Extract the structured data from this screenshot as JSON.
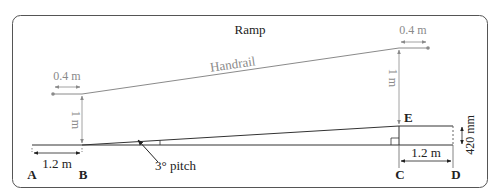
{
  "title": "Ramp",
  "labels": {
    "handrail": "Handrail",
    "left_overhang": "0.4 m",
    "right_overhang": "0.4 m",
    "left_height": "1 m",
    "right_height": "1 m",
    "left_landing": "1.2 m",
    "right_landing": "1.2 m",
    "rise": "420 mm",
    "pitch": "3° pitch"
  },
  "points": {
    "A": "A",
    "B": "B",
    "C": "C",
    "D": "D",
    "E": "E"
  },
  "colors": {
    "frame": "#555555",
    "ink": "#222222",
    "grey": "#8a8a8a"
  }
}
